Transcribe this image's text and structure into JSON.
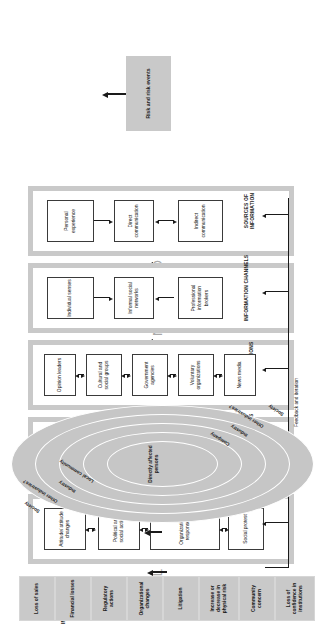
{
  "figure": {
    "main_title": "AMPLIFICATION AND ATTENUATION",
    "section_impacts": "IMPACTS",
    "section_ripple": "RIPPLE EFFECTS",
    "feedback_label": "Feedback and iteration",
    "risk_source": "Risk and risk events",
    "accent_grey": "#c9c9c9",
    "line_color": "#1a1a1a",
    "title_color": "#a9a9a9"
  },
  "bands": [
    {
      "id": "sources",
      "tag": "SOURCES OF INFORMATION",
      "nodes": [
        {
          "label": "Personal experience"
        },
        {
          "label": "Direct communication"
        },
        {
          "label": "Indirect communication"
        }
      ]
    },
    {
      "id": "channels",
      "tag": "INFORMATION CHANNELS",
      "nodes": [
        {
          "label": "Individual senses"
        },
        {
          "label": "Informal social networks"
        },
        {
          "label": "Professional information brokers"
        }
      ]
    },
    {
      "id": "social",
      "tag": "SOCIAL STATIONS",
      "nodes": [
        {
          "label": "Opinion leaders"
        },
        {
          "label": "Cultural and social groups"
        },
        {
          "label": "Government agencies"
        },
        {
          "label": "Voluntary organizations"
        },
        {
          "label": "News media"
        }
      ]
    },
    {
      "id": "individual",
      "tag": "INDIVIDUAL STATIONS",
      "nodes": [
        {
          "label": "Attention filter"
        },
        {
          "label": "Decoding"
        },
        {
          "label": "Intuitive heuristics"
        },
        {
          "label": "Evaluation and interpretation"
        },
        {
          "label": "Cognition in social context"
        }
      ]
    },
    {
      "id": "institutional",
      "tag": "INSTITUTIONAL AND SOCIAL BEHAVIOR",
      "nodes": [
        {
          "label": "Attitude/ attitude changes"
        },
        {
          "label": "Political and social action"
        },
        {
          "label": "Organizational responses"
        },
        {
          "label": "Social protest"
        }
      ]
    }
  ],
  "ripple": {
    "center": "Directly affected persons",
    "rings": [
      {
        "label": "Local community"
      },
      {
        "label": "Company"
      },
      {
        "label": "Industry"
      },
      {
        "label": "Other industries?"
      },
      {
        "label": "Society"
      }
    ],
    "left_labels": [
      "Society",
      "Other industries?",
      "Industry",
      "Local community"
    ],
    "right_labels": [
      "Company",
      "Industry",
      "Other industries?",
      "Society"
    ]
  },
  "impacts": [
    {
      "label": "Loss of sales"
    },
    {
      "label": "Financial losses"
    },
    {
      "label": "Regulatory actions"
    },
    {
      "label": "Organizational changes"
    },
    {
      "label": "Litigation"
    },
    {
      "label": "Increase or decrease in physical risk"
    },
    {
      "label": "Community concern"
    },
    {
      "label": "Loss of confidence in institutions"
    }
  ]
}
